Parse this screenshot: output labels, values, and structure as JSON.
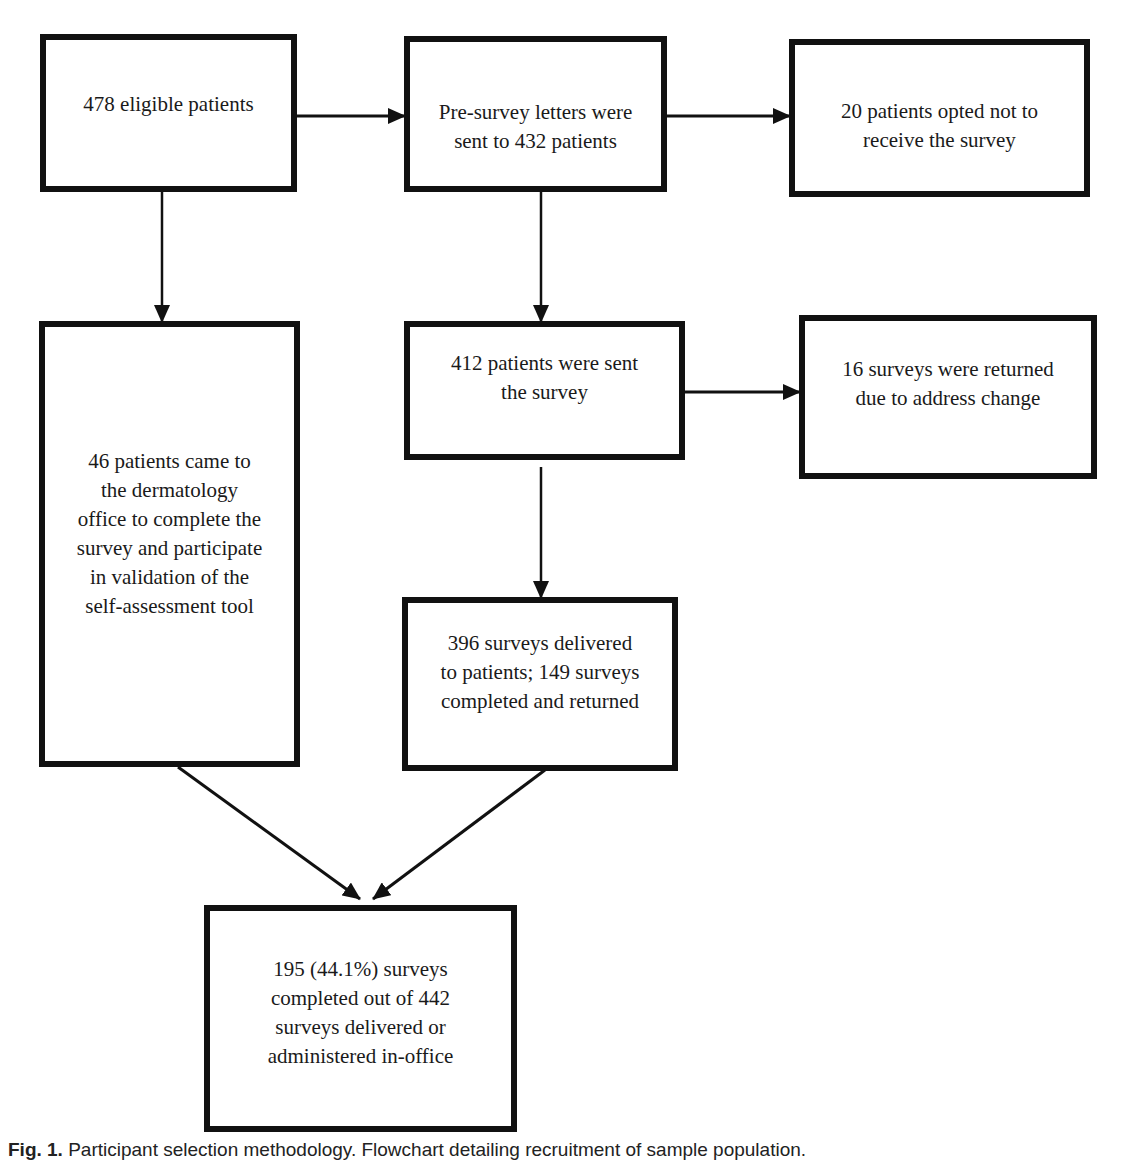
{
  "figure": {
    "type": "flowchart",
    "nodes": [
      {
        "id": "eligible",
        "lines": [
          "478 eligible patients"
        ]
      },
      {
        "id": "presurvey",
        "lines": [
          "Pre-survey letters were",
          "sent to 432 patients"
        ]
      },
      {
        "id": "optout",
        "lines": [
          "20 patients opted not to",
          "receive the survey"
        ]
      },
      {
        "id": "inoffice",
        "lines": [
          "46 patients came to",
          "the dermatology",
          "office to complete the",
          "survey and participate",
          "in validation of the",
          "self-assessment tool"
        ]
      },
      {
        "id": "sent",
        "lines": [
          "412 patients were sent",
          "the survey"
        ]
      },
      {
        "id": "returned",
        "lines": [
          "16 surveys were returned",
          "due to address change"
        ]
      },
      {
        "id": "delivered",
        "lines": [
          "396 surveys delivered",
          "to patients; 149 surveys",
          "completed and returned"
        ]
      },
      {
        "id": "total",
        "lines": [
          "195 (44.1%) surveys",
          "completed out of 442",
          "surveys delivered or",
          "administered in-office"
        ]
      }
    ],
    "edges": [
      {
        "from": "eligible",
        "to": "presurvey"
      },
      {
        "from": "presurvey",
        "to": "optout"
      },
      {
        "from": "eligible",
        "to": "inoffice"
      },
      {
        "from": "presurvey",
        "to": "sent"
      },
      {
        "from": "sent",
        "to": "returned"
      },
      {
        "from": "sent",
        "to": "delivered"
      },
      {
        "from": "inoffice",
        "to": "total"
      },
      {
        "from": "delivered",
        "to": "total"
      }
    ]
  },
  "caption": {
    "label": "Fig. 1.",
    "text": "Participant selection methodology. Flowchart detailing recruitment of sample population."
  }
}
